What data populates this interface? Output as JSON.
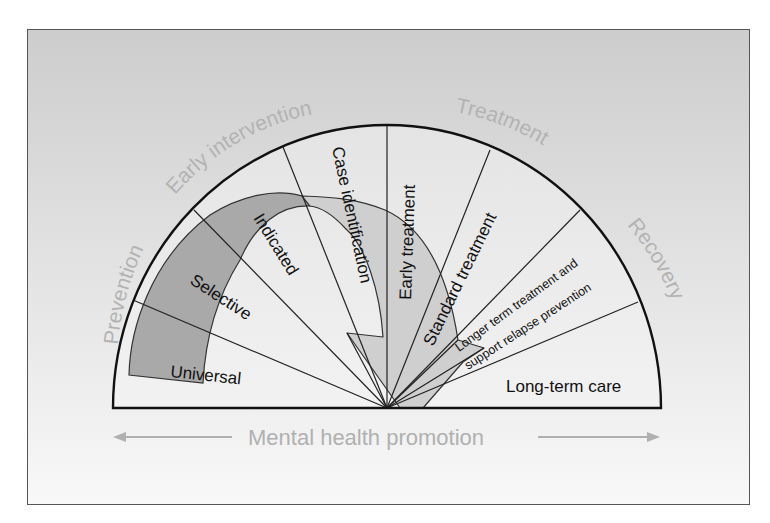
{
  "diagram": {
    "title": "",
    "phases": [
      {
        "id": "prevention",
        "label": "Prevention"
      },
      {
        "id": "early-intervention",
        "label": "Early intervention"
      },
      {
        "id": "treatment",
        "label": "Treatment"
      },
      {
        "id": "recovery",
        "label": "Recovery"
      }
    ],
    "segments": [
      {
        "id": "universal",
        "label": "Universal"
      },
      {
        "id": "selective",
        "label": "Selective"
      },
      {
        "id": "indicated",
        "label": "Indicated"
      },
      {
        "id": "case-identification",
        "label": "Case identification"
      },
      {
        "id": "early-treatment",
        "label": "Early treatment"
      },
      {
        "id": "standard-treatment",
        "label": "Standard treatment"
      },
      {
        "id": "longer-term",
        "label_line1": "Longer term treatment and",
        "label_line2": "support relapse prevention"
      },
      {
        "id": "long-term-care",
        "label": "Long-term care"
      }
    ],
    "baseline": {
      "label": "Mental health promotion"
    },
    "colors": {
      "background_top": "#cdcdcd",
      "background_bottom": "#f7f7f7",
      "semicircle_fill": "#ececec",
      "dark_band": "#a9a9a9",
      "light_band": "#cdcdcd",
      "outer_label": "#b3b3b3",
      "line": "#1a1a1a"
    }
  }
}
